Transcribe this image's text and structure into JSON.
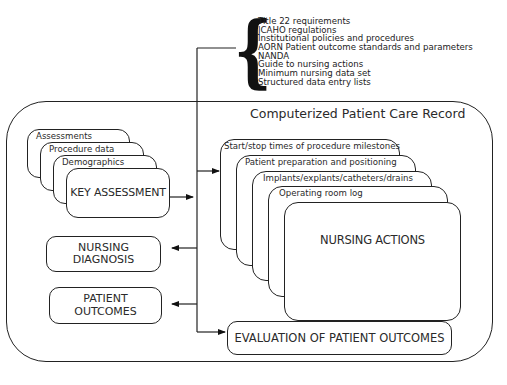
{
  "standards": {
    "items": [
      "Title 22 requirements",
      "JCAHO regulations",
      "Institutional policies and procedures",
      "AORN Patient outcome standards and parameters",
      "NANDA",
      "Guide to nursing actions",
      "Minimum nursing data set",
      "Structured data entry lists"
    ]
  },
  "record": {
    "title": "Computerized Patient Care Record"
  },
  "assessment_stack": {
    "cards": [
      "Assessments",
      "Procedure data",
      "Demographics"
    ],
    "main": "KEY ASSESSMENT"
  },
  "outputs": {
    "nursing_diagnosis": "NURSING DIAGNOSIS",
    "patient_outcomes": "PATIENT OUTCOMES"
  },
  "actions_stack": {
    "cards": [
      "Start/stop times of procedure milestones",
      "Patient preparation and positioning",
      "Implants/explants/catheters/drains",
      "Operating room log"
    ],
    "main": "NURSING ACTIONS"
  },
  "evaluation": {
    "label": "EVALUATION OF PATIENT OUTCOMES"
  }
}
